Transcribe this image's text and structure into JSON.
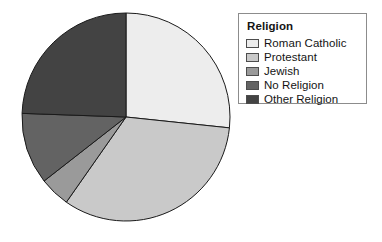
{
  "chart_data": {
    "type": "pie",
    "title": "",
    "legend_title": "Religion",
    "legend_position": "right",
    "categories": [
      "Roman Catholic",
      "Protestant",
      "Jewish",
      "No Religion",
      "Other Religion"
    ],
    "values": [
      26.7,
      33.1,
      4.7,
      11.1,
      24.4
    ],
    "units": "percent",
    "start_angle_deg": 0,
    "direction": "clockwise",
    "slice_angles_deg": [
      96,
      119,
      17,
      40,
      88
    ],
    "slice_boundaries_deg": [
      0,
      96,
      215,
      232,
      272,
      360
    ],
    "colors": [
      "#ededed",
      "#c9c9c9",
      "#9a9a9a",
      "#636363",
      "#434343"
    ],
    "slice_border_color": "#1a1a1a",
    "background": "#ffffff",
    "xlabel": "",
    "ylabel": "",
    "grid": false
  },
  "legend": {
    "title": "Religion",
    "items": [
      {
        "label": "Roman Catholic",
        "color": "#ededed"
      },
      {
        "label": "Protestant",
        "color": "#c9c9c9"
      },
      {
        "label": "Jewish",
        "color": "#9a9a9a"
      },
      {
        "label": "No Religion",
        "color": "#636363"
      },
      {
        "label": "Other Religion",
        "color": "#434343"
      }
    ]
  },
  "geometry": {
    "center_x": 126,
    "center_y": 117,
    "radius": 104
  }
}
